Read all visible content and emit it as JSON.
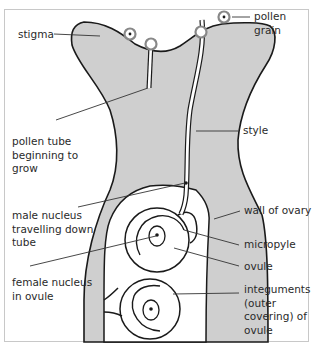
{
  "diagram": {
    "colors": {
      "tissue_fill": "#cfcfcf",
      "outline": "#1a1a1a",
      "leader_line": "#333333",
      "frame": "#c8c8c8",
      "text": "#2a2a2a"
    },
    "labels": {
      "stigma": "stigma",
      "pollen_grain": "pollen grain",
      "pollen_tube_growing": "pollen tube\nbeginning to\ngrow",
      "style": "style",
      "male_nucleus": "male nucleus\ntravelling down\ntube",
      "wall_of_ovary": "wall of ovary",
      "micropyle": "micropyle",
      "ovule": "ovule",
      "female_nucleus": "female nucleus\nin ovule",
      "integuments": "integuments\n(outer\ncovering) of\novule"
    }
  }
}
